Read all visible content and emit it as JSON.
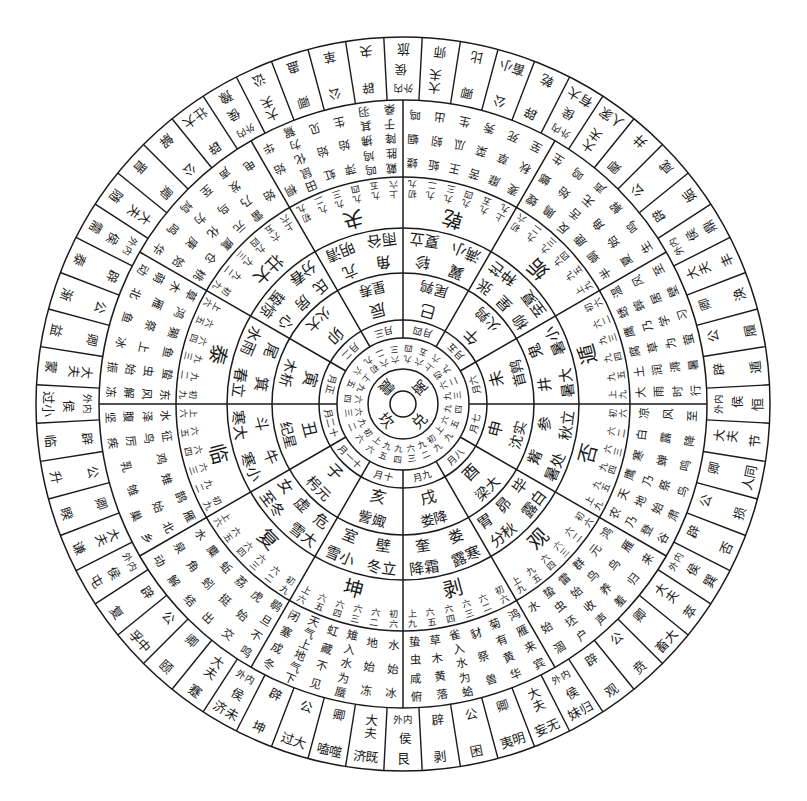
{
  "colors": {
    "ink": "#1a1a1a",
    "paper": "#ffffff"
  },
  "center_trigrams": [
    "离",
    "兑",
    "坎",
    "震"
  ],
  "trigram_line_labels": [
    "九四",
    "六五",
    "上六",
    "初九",
    "六二",
    "九三",
    "九四",
    "六五",
    "上九",
    "初九",
    "九二",
    "六三",
    "九四",
    "九五",
    "上六",
    "初六",
    "九二",
    "六三",
    "六四",
    "九五",
    "上六",
    "初九",
    "六二",
    "六三"
  ],
  "months": [
    "四月",
    "五月",
    "六月",
    "七月",
    "八月",
    "九月",
    "十月",
    "十一月",
    "十二月",
    "正月",
    "二月",
    "三月"
  ],
  "branches": [
    {
      "branch": "巳",
      "station": "鹑尾"
    },
    {
      "branch": "午",
      "station": "鹑火"
    },
    {
      "branch": "未",
      "station": "鹑首"
    },
    {
      "branch": "申",
      "station": "实沈"
    },
    {
      "branch": "酉",
      "station": "大梁"
    },
    {
      "branch": "戌",
      "station": "降娄"
    },
    {
      "branch": "亥",
      "station": "娵訾"
    },
    {
      "branch": "子",
      "station": "元枵"
    },
    {
      "branch": "丑",
      "station": "星纪"
    },
    {
      "branch": "寅",
      "station": "析木"
    },
    {
      "branch": "卯",
      "station": "大火"
    },
    {
      "branch": "辰",
      "station": "寿星"
    }
  ],
  "solar_terms": [
    "立夏",
    "小满",
    "芒种",
    "夏至",
    "小暑",
    "大暑",
    "立秋",
    "处暑",
    "白露",
    "秋分",
    "寒露",
    "霜降",
    "立冬",
    "小雪",
    "大雪",
    "冬至",
    "小寒",
    "大寒",
    "立春",
    "雨水",
    "惊蛰",
    "春分",
    "清明",
    "谷雨"
  ],
  "lunar_mansions": [
    [
      "轸",
      "翼"
    ],
    [
      "张",
      "星",
      "柳"
    ],
    [
      "鬼",
      "井"
    ],
    [
      "参",
      "觜"
    ],
    [
      "毕",
      "昴",
      "胃"
    ],
    [
      "娄",
      "奎"
    ],
    [
      "壁",
      "室"
    ],
    [
      "危",
      "虚",
      "女"
    ],
    [
      "牛",
      "斗"
    ],
    [
      "箕",
      "尾"
    ],
    [
      "心",
      "房",
      "氐"
    ],
    [
      "亢",
      "角"
    ]
  ],
  "sovereign_hexagrams": [
    {
      "name": "乾",
      "lines": [
        "初九",
        "九二",
        "九三",
        "九四",
        "九五",
        "上九"
      ]
    },
    {
      "name": "姤",
      "lines": [
        "初六",
        "九二",
        "九三",
        "九四",
        "九五",
        "上九"
      ]
    },
    {
      "name": "遁",
      "lines": [
        "初六",
        "六二",
        "九三",
        "九四",
        "九五",
        "上九"
      ]
    },
    {
      "name": "否",
      "lines": [
        "初六",
        "六二",
        "六三",
        "九四",
        "九五",
        "上九"
      ]
    },
    {
      "name": "观",
      "lines": [
        "初六",
        "六二",
        "六三",
        "六四",
        "九五",
        "上九"
      ]
    },
    {
      "name": "剥",
      "lines": [
        "初六",
        "六二",
        "六三",
        "六四",
        "六五",
        "上九"
      ]
    },
    {
      "name": "坤",
      "lines": [
        "初六",
        "六二",
        "六三",
        "六四",
        "六五",
        "上六"
      ]
    },
    {
      "name": "复",
      "lines": [
        "初九",
        "六二",
        "六三",
        "六四",
        "六五",
        "上六"
      ]
    },
    {
      "name": "临",
      "lines": [
        "初九",
        "九二",
        "六三",
        "六四",
        "六五",
        "上六"
      ]
    },
    {
      "name": "泰",
      "lines": [
        "初九",
        "九二",
        "九三",
        "六四",
        "六五",
        "上六"
      ]
    },
    {
      "name": "大壮",
      "lines": [
        "初九",
        "九二",
        "九三",
        "九四",
        "六五",
        "上六"
      ]
    },
    {
      "name": "夬",
      "lines": [
        "初九",
        "九二",
        "九三",
        "九四",
        "九五",
        "上六"
      ]
    }
  ],
  "pentads": [
    "蝼蝈鸣",
    "蚯蚓出",
    "王瓜生",
    "苦菜秀",
    "靡草死",
    "麦秋至",
    "螳螂生",
    "鵙始鸣",
    "反舌无声",
    "鹿角解",
    "蜩始鸣",
    "半夏生",
    "温风至",
    "蟋蟀居壁",
    "鹰乃学习",
    "腐草为萤",
    "土润溽暑",
    "大雨时行",
    "凉风至",
    "白露降",
    "寒蝉鸣",
    "鹰乃祭鸟",
    "天地始肃",
    "农乃登谷",
    "鸿雁来",
    "元鸟归",
    "群鸟养羞",
    "雷始收声",
    "蛰虫坯户",
    "水始涸",
    "鸿雁来宾",
    "菊有黄华",
    "豺祭兽",
    "雀入水为蛤",
    "草木黄落",
    "蛰虫咸俯",
    "水始冰",
    "地始冻",
    "雉入水为蜃",
    "虹藏不见",
    "天气上地气下",
    "闭塞成冬",
    "鹖旦不鸣",
    "虎始交",
    "荔挺出",
    "蚯蚓结",
    "麋角解",
    "水泉动",
    "雁北乡",
    "鹊始巢",
    "雉雊",
    "鸡乳",
    "征鸟厉疾",
    "水泽腹坚",
    "东风解冻",
    "蛰虫始振",
    "鱼上冰",
    "獭祭鱼",
    "鸿雁北",
    "草木萌动",
    "桃始华",
    "仓庚鸣",
    "鹰化为鸠",
    "元鸟至",
    "雷乃发声",
    "始电",
    "桐始华",
    "田鼠化为鴽",
    "虹始见",
    "萍始生",
    "鸣鸠拂其羽",
    "戴胜降于桑"
  ],
  "outer_ring": [
    {
      "rank": "侯",
      "tag": "外内",
      "name": "旅"
    },
    {
      "rank": "大夫",
      "name": "师"
    },
    {
      "rank": "卿",
      "name": "比"
    },
    {
      "rank": "公",
      "name": "小畜"
    },
    {
      "rank": "辟",
      "name": "乾"
    },
    {
      "rank": "侯",
      "tag": "外内",
      "name": "大有"
    },
    {
      "rank": "大夫",
      "name": "家人"
    },
    {
      "rank": "卿",
      "name": "井"
    },
    {
      "rank": "公",
      "name": "咸"
    },
    {
      "rank": "辟",
      "name": "姤"
    },
    {
      "rank": "侯",
      "tag": "外内",
      "name": "鼎"
    },
    {
      "rank": "大夫",
      "name": "丰"
    },
    {
      "rank": "卿",
      "name": "涣"
    },
    {
      "rank": "公",
      "name": "履"
    },
    {
      "rank": "辟",
      "name": "遁"
    },
    {
      "rank": "侯",
      "tag": "外内",
      "name": "恒"
    },
    {
      "rank": "大夫",
      "name": "节"
    },
    {
      "rank": "卿",
      "name": "同人"
    },
    {
      "rank": "公",
      "name": "损"
    },
    {
      "rank": "辟",
      "name": "否"
    },
    {
      "rank": "侯",
      "tag": "外内",
      "name": "巽"
    },
    {
      "rank": "大夫",
      "name": "萃"
    },
    {
      "rank": "卿",
      "name": "大畜"
    },
    {
      "rank": "公",
      "name": "贲"
    },
    {
      "rank": "辟",
      "name": "观"
    },
    {
      "rank": "侯",
      "tag": "外内",
      "name": "归妹"
    },
    {
      "rank": "大夫",
      "name": "无妄"
    },
    {
      "rank": "卿",
      "name": "明夷"
    },
    {
      "rank": "公",
      "name": "困"
    },
    {
      "rank": "辟",
      "name": "剥"
    },
    {
      "rank": "侯",
      "tag": "外内",
      "name": "艮"
    },
    {
      "rank": "大夫",
      "name": "既济"
    },
    {
      "rank": "卿",
      "name": "噬嗑"
    },
    {
      "rank": "公",
      "name": "大过"
    },
    {
      "rank": "辟",
      "name": "坤"
    },
    {
      "rank": "侯",
      "tag": "外内",
      "name": "未济"
    },
    {
      "rank": "大夫",
      "name": "蹇"
    },
    {
      "rank": "卿",
      "name": "颐"
    },
    {
      "rank": "公",
      "name": "中孚"
    },
    {
      "rank": "辟",
      "name": "复"
    },
    {
      "rank": "侯",
      "tag": "外内",
      "name": "屯"
    },
    {
      "rank": "大夫",
      "name": "谦"
    },
    {
      "rank": "卿",
      "name": "睽"
    },
    {
      "rank": "公",
      "name": "升"
    },
    {
      "rank": "辟",
      "name": "临"
    },
    {
      "r​ank": "侯",
      "rank": "侯",
      "tag": "外内",
      "name": "小过"
    },
    {
      "rank": "大夫",
      "name": "蒙"
    },
    {
      "rank": "卿",
      "name": "益"
    },
    {
      "rank": "公",
      "name": "渐"
    },
    {
      "rank": "辟",
      "name": "泰"
    },
    {
      "rank": "侯",
      "tag": "外内",
      "name": "需"
    },
    {
      "rank": "大夫",
      "name": "随"
    },
    {
      "rank": "卿",
      "name": "晋"
    },
    {
      "rank": "公",
      "name": "解"
    },
    {
      "rank": "辟",
      "name": "大壮"
    },
    {
      "rank": "侯",
      "tag": "外内",
      "name": "豫"
    },
    {
      "rank": "大夫",
      "name": "讼"
    },
    {
      "rank": "卿",
      "name": "蛊"
    },
    {
      "rank": "公",
      "name": "革"
    },
    {
      "rank": "辟",
      "name": "夬"
    }
  ]
}
